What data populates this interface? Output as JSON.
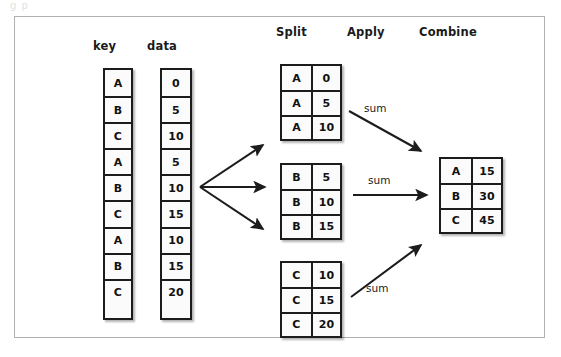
{
  "page": {
    "top_sliver_text": "g        p"
  },
  "figure": {
    "headers": [
      {
        "name": "key",
        "label": "key"
      },
      {
        "name": "data",
        "label": "data"
      },
      {
        "name": "split",
        "label": "Split"
      },
      {
        "name": "apply",
        "label": "Apply"
      },
      {
        "name": "combine",
        "label": "Combine"
      }
    ],
    "input": {
      "key_header": "key",
      "data_header": "data",
      "keys": [
        "A",
        "B",
        "C",
        "A",
        "B",
        "C",
        "A",
        "B",
        "C"
      ],
      "values": [
        "0",
        "5",
        "10",
        "5",
        "10",
        "15",
        "10",
        "15",
        "20"
      ]
    },
    "split_groups": [
      {
        "name": "group-a",
        "rows": [
          [
            "A",
            "0"
          ],
          [
            "A",
            "5"
          ],
          [
            "A",
            "10"
          ]
        ]
      },
      {
        "name": "group-b",
        "rows": [
          [
            "B",
            "5"
          ],
          [
            "B",
            "10"
          ],
          [
            "B",
            "15"
          ]
        ]
      },
      {
        "name": "group-c",
        "rows": [
          [
            "C",
            "10"
          ],
          [
            "C",
            "15"
          ],
          [
            "C",
            "20"
          ]
        ]
      }
    ],
    "apply_labels": [
      "sum",
      "sum",
      "sum"
    ],
    "combine_table": {
      "rows": [
        [
          "A",
          "15"
        ],
        [
          "B",
          "30"
        ],
        [
          "C",
          "45"
        ]
      ]
    },
    "colors": {
      "ink": "#1c1c1c",
      "cell_fill": "#fbfbfb",
      "frame": "#b0b0b0",
      "page": "#ffffff"
    }
  }
}
